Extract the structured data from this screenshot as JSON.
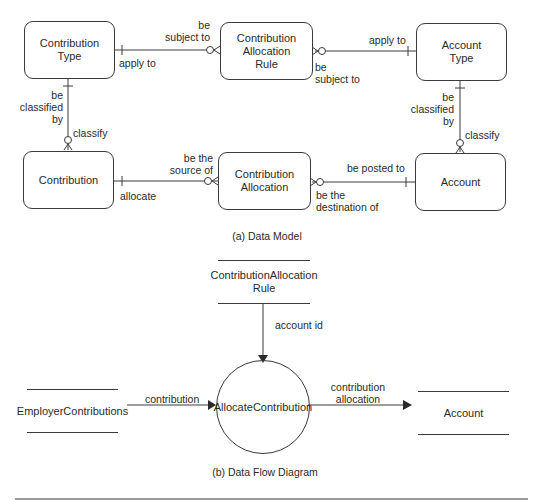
{
  "data_model": {
    "caption": "(a) Data Model",
    "entities": {
      "contribution_type": [
        "Contribution",
        "Type"
      ],
      "contribution_allocation_rule": [
        "Contribution",
        "Allocation",
        "Rule"
      ],
      "account_type": [
        "Account",
        "Type"
      ],
      "contribution": [
        "Contribution"
      ],
      "contribution_allocation": [
        "Contribution",
        "Allocation"
      ],
      "account": [
        "Account"
      ]
    },
    "relationships": {
      "ct_car_forward": "apply to",
      "ct_car_reverse": [
        "be",
        "subject to"
      ],
      "at_car_forward": "apply to",
      "at_car_reverse": [
        "be",
        "subject to"
      ],
      "ct_c_reverse": [
        "be",
        "classified",
        "by"
      ],
      "ct_c_forward": "classify",
      "at_a_reverse": [
        "be",
        "classified",
        "by"
      ],
      "at_a_forward": "classify",
      "c_ca_forward": "allocate",
      "c_ca_reverse": [
        "be the",
        "source of"
      ],
      "a_ca_forward": "be posted to",
      "a_ca_reverse": [
        "be the",
        "destination of"
      ]
    }
  },
  "data_flow": {
    "caption": "(b) Data Flow Diagram",
    "stores": {
      "rule": [
        "Contribution",
        "Allocation Rule"
      ],
      "employer": [
        "Employer",
        "Contributions"
      ],
      "account": [
        "Account"
      ]
    },
    "process": [
      "Allocate",
      "Contribution"
    ],
    "flows": {
      "account_id": "account id",
      "contribution": "contribution",
      "allocation": [
        "contribution",
        "allocation"
      ]
    }
  },
  "colors": {
    "line": "#3a3a3a",
    "text": "#2a2a2a",
    "background": "#ffffff"
  }
}
